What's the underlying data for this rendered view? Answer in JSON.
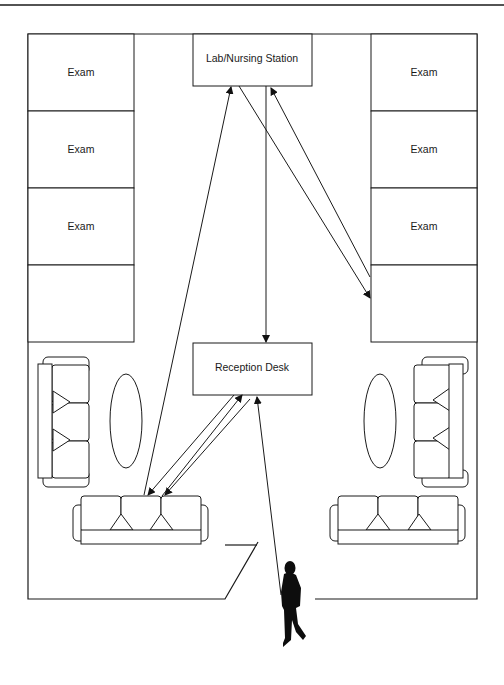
{
  "diagram": {
    "type": "floor-plan-patient-flow",
    "rooms": {
      "left_exam": [
        {
          "label": "Exam"
        },
        {
          "label": "Exam"
        },
        {
          "label": "Exam"
        },
        {
          "label": ""
        }
      ],
      "right_exam": [
        {
          "label": "Exam"
        },
        {
          "label": "Exam"
        },
        {
          "label": "Exam"
        },
        {
          "label": ""
        }
      ],
      "lab": {
        "label": "Lab/Nursing Station"
      },
      "reception": {
        "label": "Reception Desk"
      }
    },
    "furniture": {
      "waiting_areas": 2,
      "sofas_per_area": 2,
      "tables_per_area": 1
    },
    "flows": [
      {
        "from": "entrance",
        "to": "Reception Desk"
      },
      {
        "from": "Reception Desk",
        "to": "left waiting sofa"
      },
      {
        "from": "Reception Desk",
        "to": "left waiting sofa"
      },
      {
        "from": "left waiting sofa",
        "to": "Reception Desk"
      },
      {
        "from": "left waiting sofa",
        "to": "Lab/Nursing Station"
      },
      {
        "from": "Lab/Nursing Station",
        "to": "Reception Desk"
      },
      {
        "from": "Lab/Nursing Station",
        "to": "right exam room"
      },
      {
        "from": "right exam room",
        "to": "Lab/Nursing Station"
      }
    ],
    "figure": "person-walking-silhouette",
    "colors": {
      "line": "#1a1a1a",
      "background": "#ffffff"
    }
  }
}
